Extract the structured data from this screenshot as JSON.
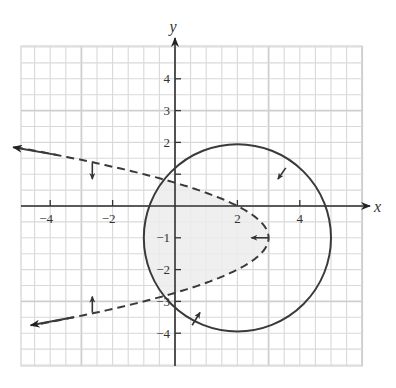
{
  "chart_data": {
    "type": "region-plot",
    "title": "",
    "xlabel": "x",
    "ylabel": "y",
    "xlim": [
      -5,
      6
    ],
    "ylim": [
      -5,
      5
    ],
    "grid": true,
    "grid_step": 0.5,
    "x_ticks": [
      -4,
      -2,
      2,
      4
    ],
    "x_tick_labels": [
      "−4",
      "−2",
      "2",
      "4"
    ],
    "y_ticks": [
      4,
      3,
      2,
      1,
      -1,
      -2,
      -3,
      -4
    ],
    "y_tick_labels": [
      "4",
      "3",
      "2",
      "",
      "−1",
      "−2",
      "−3",
      "−4"
    ],
    "curves": [
      {
        "name": "circle",
        "equation": "(x-2)^2 + (y+1)^2 = 9",
        "center": [
          2,
          -1
        ],
        "radius": 3,
        "style": "solid",
        "shade_side": "inside"
      },
      {
        "name": "parabola",
        "equation": "x = 3 - (y+1)^2",
        "vertex": [
          3,
          -1
        ],
        "opens": "left",
        "style": "dashed",
        "shade_side": "inside (left of vertex)"
      }
    ],
    "shaded_region": "intersection of circle interior and parabola interior",
    "colors": {
      "grid": "#d9d9d9",
      "axis": "#333333",
      "curve": "#3a3a3a",
      "shade": "#ececec"
    }
  }
}
